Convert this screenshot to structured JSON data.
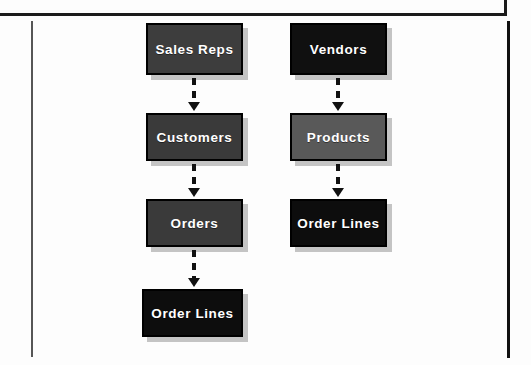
{
  "page": {
    "background_color": "#fdfdfd",
    "rule_color": "#1b1b1b",
    "left_rule_color": "#565656",
    "right_rule_color": "#111111"
  },
  "diagram": {
    "type": "flowchart",
    "orientation": "top-to-bottom",
    "connector_style": "dashed-arrow",
    "columns": [
      {
        "name": "sales-chain",
        "nodes": [
          {
            "label": "Sales Reps",
            "fill": "#3d3d3d",
            "text_color": "#ffffff"
          },
          {
            "label": "Customers",
            "fill": "#3a3a3a",
            "text_color": "#ffffff"
          },
          {
            "label": "Orders",
            "fill": "#3a3a3a",
            "text_color": "#ffffff"
          },
          {
            "label": "Order Lines",
            "fill": "#0d0d0d",
            "text_color": "#ffffff"
          }
        ],
        "edges": [
          {
            "from": "Sales Reps",
            "to": "Customers"
          },
          {
            "from": "Customers",
            "to": "Orders"
          },
          {
            "from": "Orders",
            "to": "Order Lines"
          }
        ]
      },
      {
        "name": "purchasing-chain",
        "nodes": [
          {
            "label": "Vendors",
            "fill": "#101010",
            "text_color": "#ffffff"
          },
          {
            "label": "Products",
            "fill": "#595959",
            "text_color": "#ffffff"
          },
          {
            "label": "Order Lines",
            "fill": "#0d0d0d",
            "text_color": "#ffffff"
          }
        ],
        "edges": [
          {
            "from": "Vendors",
            "to": "Products"
          },
          {
            "from": "Products",
            "to": "Order Lines"
          }
        ]
      }
    ]
  }
}
